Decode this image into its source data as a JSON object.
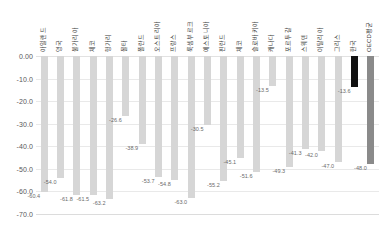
{
  "chart_data": {
    "type": "bar",
    "title": "",
    "subtitle": "",
    "xlabel": "",
    "ylabel": "",
    "ylim": [
      -70.0,
      0.0
    ],
    "grid": true,
    "legend": false,
    "orientation": "vertical",
    "value_suffix": "",
    "ytick_labels": [
      "0.00",
      "-10.0",
      "-20.0",
      "-30.0",
      "-40.0",
      "-50.0",
      "-60.0",
      "-70.0"
    ],
    "ytick_values": [
      0.0,
      -10.0,
      -20.0,
      -30.0,
      -40.0,
      -50.0,
      -60.0,
      -70.0
    ],
    "categories": [
      "아일랜드",
      "영국",
      "불가리아",
      "체코",
      "헝가리",
      "몰타",
      "폴란드",
      "오스트리아",
      "프랑스",
      "룩셈부르크",
      "에스토니아",
      "핀란드",
      "체코",
      "슬로바키아",
      "캐나다",
      "포르투갈",
      "스웨덴",
      "이탈리아",
      "그리스",
      "한국",
      "OECD평균"
    ],
    "values": [
      -60.4,
      -54.0,
      -61.8,
      -61.5,
      -63.2,
      -26.6,
      -38.9,
      -53.7,
      -54.8,
      -63.0,
      -30.5,
      -55.2,
      -45.1,
      -51.6,
      -13.5,
      -49.3,
      -41.3,
      -42.0,
      -47.0,
      -13.6,
      -48.0
    ],
    "value_labels": [
      "-60.4",
      "-54.0",
      "-61.8",
      "-61.5",
      "-63.2",
      "-26.6",
      "-38.9",
      "-53.7",
      "-54.8",
      "-63.0",
      "-30.5",
      "-55.2",
      "-45.1",
      "-51.6",
      "-13.5",
      "-49.3",
      "-41.3",
      "-42.0",
      "-47.0",
      "-13.6",
      "-48.0"
    ],
    "bar_styles": [
      "light",
      "light",
      "light",
      "light",
      "light",
      "light",
      "light",
      "light",
      "light",
      "light",
      "light",
      "light",
      "light",
      "light",
      "light",
      "light",
      "light",
      "light",
      "light",
      "dark",
      "mid"
    ],
    "colors": {
      "bar_light": "#d6d6d6",
      "bar_dark": "#111111",
      "bar_mid": "#8a8a8a",
      "grid": "#e9e9e9",
      "tick_text": "#595959",
      "value_text": "#6b6b6b",
      "category_text": "#3a3a3a",
      "background": "#ffffff"
    }
  }
}
